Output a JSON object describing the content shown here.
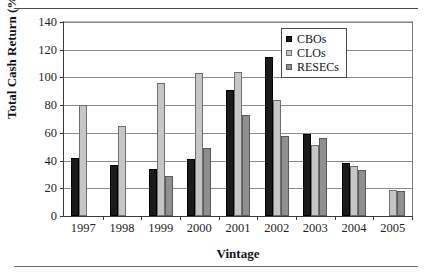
{
  "chart_data": {
    "type": "bar",
    "title": "",
    "xlabel": "Vintage",
    "ylabel": "Total Cash Return (%)",
    "categories": [
      "1997",
      "1998",
      "1999",
      "2000",
      "2001",
      "2002",
      "2003",
      "2004",
      "2005"
    ],
    "series": [
      {
        "name": "CBOs",
        "color": "#1b1b1b",
        "values": [
          42,
          37,
          34,
          41,
          91,
          115,
          59,
          38,
          null
        ]
      },
      {
        "name": "CLOs",
        "color": "#c6c6c6",
        "values": [
          80,
          65,
          96,
          103,
          104,
          84,
          51,
          36,
          19
        ]
      },
      {
        "name": "RESECs",
        "color": "#8f8f8f",
        "values": [
          null,
          null,
          29,
          49,
          73,
          58,
          56,
          33,
          18
        ]
      }
    ],
    "ylim": [
      0,
      140
    ],
    "yticks": [
      0,
      20,
      40,
      60,
      80,
      100,
      120,
      140
    ],
    "ytick_labels": [
      "0",
      "20",
      "40",
      "60",
      "80",
      "100",
      "120",
      "140"
    ],
    "grid": true,
    "legend_position": "top-right"
  }
}
